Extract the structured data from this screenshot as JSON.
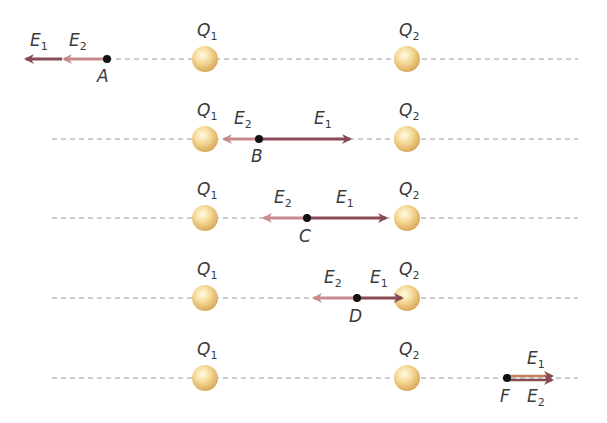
{
  "colors": {
    "e1": "#8a4a55",
    "e2": "#c98a8e",
    "e1_f": "#b87a5a",
    "dashed_line": "#9a9a9a",
    "point": "#111111",
    "charge_light": "#fff6d8",
    "charge_mid": "#f6d690",
    "charge_dark": "#d9ac5c"
  },
  "charges": {
    "q1": {
      "label": "Q",
      "sub": "1",
      "x": 205
    },
    "q2": {
      "label": "Q",
      "sub": "2",
      "x": 407
    }
  },
  "rows": [
    {
      "point": "A",
      "y": 59,
      "point_x": 107,
      "e1_tip": 24,
      "e2_tip": 62
    },
    {
      "point": "B",
      "y": 139,
      "point_x": 259,
      "e1_tip": 352,
      "e2_tip": 222
    },
    {
      "point": "C",
      "y": 218,
      "point_x": 307,
      "e1_tip": 388,
      "e2_tip": 262
    },
    {
      "point": "D",
      "y": 298,
      "point_x": 357,
      "e1_tip": 404,
      "e2_tip": 312
    },
    {
      "point": "F",
      "y": 378,
      "point_x": 507,
      "e1_tip": 555,
      "e2_tip": 555
    }
  ],
  "labels": {
    "e": "E",
    "e1_sub": "1",
    "e2_sub": "2",
    "points": [
      "A",
      "B",
      "C",
      "D",
      "F"
    ]
  }
}
